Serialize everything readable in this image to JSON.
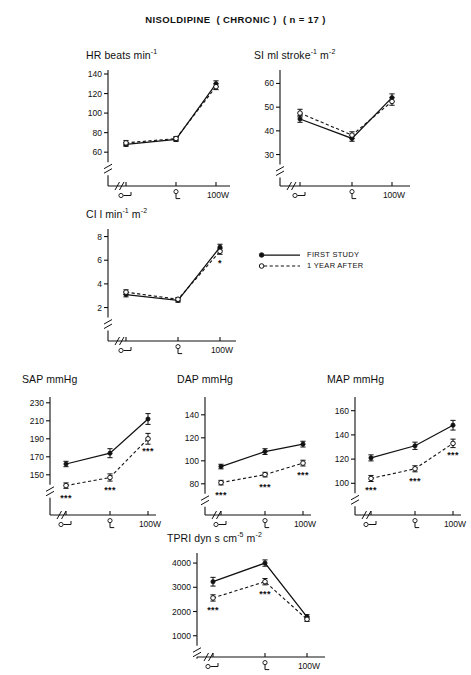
{
  "figure": {
    "title": "NISOLDIPINE  ( CHRONIC )  ( n = 17 )",
    "legend": [
      {
        "label": "FIRST STUDY",
        "marker": "filled-circle",
        "line": "solid"
      },
      {
        "label": "1 YEAR AFTER",
        "marker": "open-circle",
        "line": "dashed"
      }
    ],
    "x_categories": [
      "supine",
      "sitting",
      "100W"
    ],
    "x_tick_labels": [
      "",
      "",
      "100W"
    ],
    "significance_symbol": "***",
    "series_names": [
      "FIRST STUDY",
      "1 YEAR AFTER"
    ]
  },
  "chart_data": [
    {
      "id": "hr",
      "type": "line",
      "title": "HR beats min",
      "title_sup": "-1",
      "ylabel": "HR beats min-1",
      "xlabel": "",
      "categories": [
        "supine",
        "sitting",
        "100W"
      ],
      "ticks": [
        60,
        80,
        100,
        120,
        140
      ],
      "ylim": [
        52,
        140
      ],
      "axis_break": true,
      "series": [
        {
          "name": "FIRST STUDY",
          "values": [
            68,
            73,
            130
          ],
          "errors": [
            2,
            2,
            3
          ],
          "sig": [
            "",
            "",
            ""
          ]
        },
        {
          "name": "1 YEAR AFTER",
          "values": [
            69.5,
            74,
            127
          ],
          "errors": [
            2.5,
            2,
            3
          ],
          "sig": [
            "",
            "",
            ""
          ]
        }
      ]
    },
    {
      "id": "si",
      "type": "line",
      "title": "SI ml stroke",
      "title_sup": "-1",
      "title_tail": " m",
      "title_sup2": "-2",
      "ylabel": "SI ml stroke-1 m-2",
      "xlabel": "",
      "categories": [
        "supine",
        "sitting",
        "100W"
      ],
      "ticks": [
        30,
        40,
        50,
        60
      ],
      "ylim": [
        26,
        64
      ],
      "axis_break": true,
      "series": [
        {
          "name": "FIRST STUDY",
          "values": [
            45,
            36.8,
            54
          ],
          "errors": [
            1.4,
            1.2,
            1.6
          ],
          "sig": [
            "",
            "",
            ""
          ]
        },
        {
          "name": "1 YEAR AFTER",
          "values": [
            47.5,
            38.2,
            52.4
          ],
          "errors": [
            1.6,
            1.4,
            1.6
          ],
          "sig": [
            "",
            "",
            ""
          ]
        }
      ]
    },
    {
      "id": "ci",
      "type": "line",
      "title": "CI l min",
      "title_sup": "-1",
      "title_tail": " m",
      "title_sup2": "-2",
      "ylabel": "CI l min-1 m-2",
      "xlabel": "",
      "categories": [
        "supine",
        "sitting",
        "100W"
      ],
      "ticks": [
        2,
        4,
        6,
        8
      ],
      "ylim": [
        1.2,
        8.3
      ],
      "axis_break": true,
      "series": [
        {
          "name": "FIRST STUDY",
          "values": [
            3.1,
            2.6,
            7.1
          ],
          "errors": [
            0.2,
            0.15,
            0.25
          ],
          "sig": [
            "",
            "",
            ""
          ]
        },
        {
          "name": "1 YEAR AFTER",
          "values": [
            3.3,
            2.7,
            6.75
          ],
          "errors": [
            0.2,
            0.15,
            0.25
          ],
          "sig": [
            "",
            "",
            "*"
          ]
        }
      ]
    },
    {
      "id": "sap",
      "type": "line",
      "title": "SAP mmHg",
      "ylabel": "SAP mmHg",
      "xlabel": "",
      "categories": [
        "supine",
        "sitting",
        "100W"
      ],
      "ticks": [
        150,
        170,
        190,
        210,
        230
      ],
      "ylim": [
        132,
        232
      ],
      "axis_break": true,
      "series": [
        {
          "name": "FIRST STUDY",
          "values": [
            162,
            174,
            212
          ],
          "errors": [
            3,
            5,
            6
          ],
          "sig": [
            "",
            "",
            ""
          ]
        },
        {
          "name": "1 YEAR AFTER",
          "values": [
            138,
            147,
            190
          ],
          "errors": [
            3,
            4,
            6
          ],
          "sig": [
            "***",
            "***",
            "***"
          ]
        }
      ]
    },
    {
      "id": "dap",
      "type": "line",
      "title": "DAP mmHg",
      "ylabel": "DAP mmHg",
      "xlabel": "",
      "categories": [
        "supine",
        "sitting",
        "100W"
      ],
      "ticks": [
        80,
        100,
        120,
        140
      ],
      "ylim": [
        72,
        152
      ],
      "axis_break": true,
      "series": [
        {
          "name": "FIRST STUDY",
          "values": [
            95,
            108,
            114.5
          ],
          "errors": [
            2,
            2.5,
            2.5
          ],
          "sig": [
            "",
            "",
            ""
          ]
        },
        {
          "name": "1 YEAR AFTER",
          "values": [
            81,
            88,
            98
          ],
          "errors": [
            2,
            2,
            2.5
          ],
          "sig": [
            "***",
            "***",
            "***"
          ]
        }
      ]
    },
    {
      "id": "map",
      "type": "line",
      "title": "MAP mmHg",
      "ylabel": "MAP mmHg",
      "xlabel": "",
      "categories": [
        "supine",
        "sitting",
        "100W"
      ],
      "ticks": [
        100,
        120,
        140,
        160
      ],
      "ylim": [
        92,
        168
      ],
      "axis_break": true,
      "series": [
        {
          "name": "FIRST STUDY",
          "values": [
            121,
            131,
            148
          ],
          "errors": [
            2.5,
            3,
            4
          ],
          "sig": [
            "",
            "",
            ""
          ]
        },
        {
          "name": "1 YEAR AFTER",
          "values": [
            104,
            112,
            133
          ],
          "errors": [
            2.5,
            2.5,
            3.5
          ],
          "sig": [
            "***",
            "***",
            "***"
          ]
        }
      ]
    },
    {
      "id": "tpri",
      "type": "line",
      "title": "TPRI dyn s cm",
      "title_sup": "-5",
      "title_tail": " m",
      "title_sup2": "-2",
      "ylabel": "TPRI dyn s cm-5 m-2",
      "xlabel": "",
      "categories": [
        "supine",
        "sitting",
        "100W"
      ],
      "ticks": [
        1000,
        2000,
        3000,
        4000
      ],
      "ylim": [
        700,
        4250
      ],
      "axis_break": true,
      "series": [
        {
          "name": "FIRST STUDY",
          "values": [
            3230,
            4000,
            1780
          ],
          "errors": [
            180,
            130,
            90
          ],
          "sig": [
            "",
            "",
            ""
          ]
        },
        {
          "name": "1 YEAR AFTER",
          "values": [
            2560,
            3230,
            1680
          ],
          "errors": [
            130,
            130,
            90
          ],
          "sig": [
            "***",
            "***",
            ""
          ]
        }
      ]
    }
  ]
}
